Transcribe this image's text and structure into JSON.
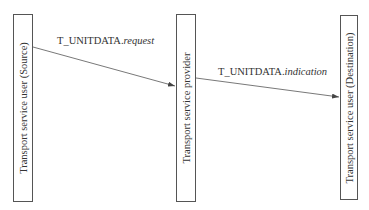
{
  "diagram": {
    "participants": [
      {
        "id": "source",
        "label": "Transport service user (Source)"
      },
      {
        "id": "provider",
        "label": "Transport service provider"
      },
      {
        "id": "destination",
        "label": "Transport service user (Destination)"
      }
    ],
    "messages": [
      {
        "from": "source",
        "to": "provider",
        "primitive": "T_UNITDATA.",
        "type": "request"
      },
      {
        "from": "provider",
        "to": "destination",
        "primitive": "T_UNITDATA.",
        "type": "indication"
      }
    ],
    "colors": {
      "line": "#555555",
      "text": "#333333",
      "background": "#ffffff"
    }
  }
}
